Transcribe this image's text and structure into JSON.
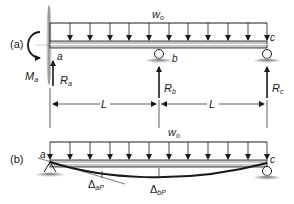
{
  "figure": {
    "panels": [
      {
        "id": "a",
        "label": "(a)",
        "load_label": "w",
        "load_sub": "o",
        "points": [
          {
            "name": "a",
            "label": "a"
          },
          {
            "name": "b",
            "label": "b"
          },
          {
            "name": "c",
            "label": "c"
          }
        ],
        "moment_label": "M",
        "moment_sub": "a",
        "reactions": [
          {
            "label": "R",
            "sub": "a"
          },
          {
            "label": "R",
            "sub": "b"
          },
          {
            "label": "R",
            "sub": "c"
          }
        ],
        "spans": [
          {
            "label": "L"
          },
          {
            "label": "L"
          }
        ]
      },
      {
        "id": "b",
        "label": "(b)",
        "load_label": "w",
        "load_sub": "o",
        "points": [
          {
            "name": "a",
            "label": "a"
          },
          {
            "name": "c",
            "label": "c"
          }
        ],
        "deflections": [
          {
            "symbol": "Δ",
            "sub": "aP"
          },
          {
            "symbol": "Δ",
            "sub": "bP"
          }
        ]
      }
    ],
    "colors": {
      "ink": "#1a1a1a",
      "beam_fill": "#c8c8c8",
      "wall": "#9a9a9a",
      "ground": "#8a8a8a"
    }
  }
}
